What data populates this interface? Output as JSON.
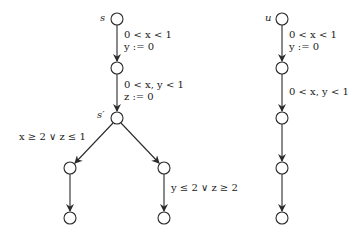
{
  "diagram": {
    "type": "timed-automaton-runs",
    "left_tree": {
      "nodes": [
        {
          "id": "s",
          "label": "s",
          "x": 117,
          "y": 19
        },
        {
          "id": "n1",
          "label": "",
          "x": 117,
          "y": 68
        },
        {
          "id": "s_prime",
          "label": "s′",
          "x": 117,
          "y": 118
        },
        {
          "id": "l1",
          "label": "",
          "x": 70,
          "y": 168
        },
        {
          "id": "r1",
          "label": "",
          "x": 164,
          "y": 168
        },
        {
          "id": "l2",
          "label": "",
          "x": 70,
          "y": 218
        },
        {
          "id": "r2",
          "label": "",
          "x": 164,
          "y": 218
        }
      ],
      "edges": [
        {
          "from": "s",
          "to": "n1",
          "guard": "0 < x < 1",
          "reset": "y := 0"
        },
        {
          "from": "n1",
          "to": "s_prime",
          "guard": "0 < x, y < 1",
          "reset": "z := 0"
        },
        {
          "from": "s_prime",
          "to": "l1",
          "guard": "x ≥ 2 ∨ z ≤ 1"
        },
        {
          "from": "s_prime",
          "to": "r1",
          "guard": ""
        },
        {
          "from": "l1",
          "to": "l2",
          "guard": ""
        },
        {
          "from": "r1",
          "to": "r2",
          "guard": "y ≤ 2 ∨ z ≥ 2"
        }
      ]
    },
    "right_chain": {
      "nodes": [
        {
          "id": "u",
          "label": "u",
          "x": 282,
          "y": 19
        },
        {
          "id": "u1",
          "label": "",
          "x": 282,
          "y": 68
        },
        {
          "id": "u2",
          "label": "",
          "x": 282,
          "y": 118
        },
        {
          "id": "u3",
          "label": "",
          "x": 282,
          "y": 168
        },
        {
          "id": "u4",
          "label": "",
          "x": 282,
          "y": 218
        }
      ],
      "edges": [
        {
          "from": "u",
          "to": "u1",
          "guard": "0 < x < 1",
          "reset": "y := 0"
        },
        {
          "from": "u1",
          "to": "u2",
          "guard": "0 < x, y < 1"
        },
        {
          "from": "u2",
          "to": "u3",
          "guard": ""
        },
        {
          "from": "u3",
          "to": "u4",
          "guard": ""
        }
      ]
    },
    "labels": {
      "s": "s",
      "s_prime": "s′",
      "u": "u",
      "e1_guard": "0 < x < 1",
      "e1_reset": "y := 0",
      "e2_guard": "0 < x, y < 1",
      "e2_reset": "z := 0",
      "left_branch": "x ≥ 2 ∨ z ≤ 1",
      "right_branch": "y ≤ 2 ∨ z ≥ 2",
      "u_e1_guard": "0 < x < 1",
      "u_e1_reset": "y := 0",
      "u_e2_guard": "0 < x, y < 1"
    }
  }
}
